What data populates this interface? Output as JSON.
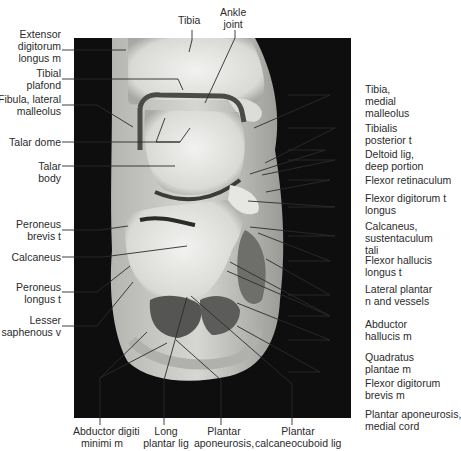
{
  "figure": {
    "type": "MRI coronal section of ankle/hindfoot with anatomical labels",
    "colors": {
      "background": "#ffffff",
      "image_bg": "#0e0e0e",
      "text": "#2b2b2b",
      "leader": "#2b2b2b"
    }
  },
  "labels": {
    "top": [
      {
        "id": "tibia",
        "text": "Tibia"
      },
      {
        "id": "ankle_joint",
        "text": "Ankle\njoint"
      }
    ],
    "left": [
      {
        "id": "extensor_digitorum_longus",
        "text": "Extensor\ndigitorum\nlongus m"
      },
      {
        "id": "tibial_plafond",
        "text": "Tibial\nplafond"
      },
      {
        "id": "fibula_lateral_malleolus",
        "text": "Fibula, lateral\nmalleolus"
      },
      {
        "id": "talar_dome",
        "text": "Talar dome"
      },
      {
        "id": "talar_body",
        "text": "Talar\nbody"
      },
      {
        "id": "peroneus_brevis",
        "text": "Peroneus\nbrevis t"
      },
      {
        "id": "calcaneus",
        "text": "Calcaneus"
      },
      {
        "id": "peroneus_longus",
        "text": "Peroneus\nlongus t"
      },
      {
        "id": "lesser_saphenous",
        "text": "Lesser\nsaphenous v"
      }
    ],
    "right": [
      {
        "id": "tibia_medial_malleolus",
        "text": "Tibia,\nmedial\nmalleolus"
      },
      {
        "id": "tibialis_posterior",
        "text": "Tibialis\nposterior t"
      },
      {
        "id": "deltoid_lig",
        "text": "Deltoid lig,\ndeep portion"
      },
      {
        "id": "flexor_retinaculum",
        "text": "Flexor retinaculum"
      },
      {
        "id": "flexor_digitorum_longus",
        "text": "Flexor digitorum t\nlongus"
      },
      {
        "id": "calcaneus_sustentaculum",
        "text": "Calcaneus,\nsustentaculum\ntali"
      },
      {
        "id": "flexor_hallucis_longus",
        "text": "Flexor hallucis\nlongus t"
      },
      {
        "id": "lateral_plantar",
        "text": "Lateral plantar\nn and vessels"
      },
      {
        "id": "abductor_hallucis",
        "text": "Abductor\nhallucis m"
      },
      {
        "id": "quadratus_plantae",
        "text": "Quadratus\nplantae m"
      },
      {
        "id": "flexor_digitorum_brevis",
        "text": "Flexor digitorum\nbrevis m"
      },
      {
        "id": "plantar_aponeurosis_medial",
        "text": "Plantar aponeurosis,\nmedial cord"
      }
    ],
    "bottom": [
      {
        "id": "abductor_digiti_minimi",
        "text": "Abductor digiti\nminimi m"
      },
      {
        "id": "long_plantar_lig",
        "text": "Long\nplantar lig"
      },
      {
        "id": "plantar_aponeurosis",
        "text": "Plantar\naponeurosis,"
      },
      {
        "id": "plantar_calcaneocuboid",
        "text": "Plantar\ncalcaneocuboid lig"
      }
    ]
  }
}
